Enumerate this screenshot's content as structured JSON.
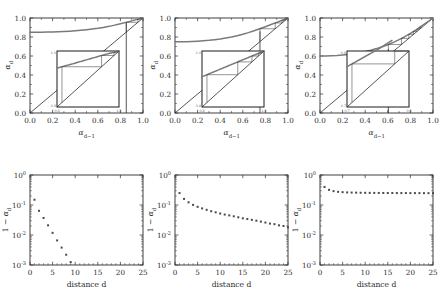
{
  "figure": {
    "panel_count": 6,
    "rows": 2,
    "columns": 3
  },
  "axes": {
    "top_xlabel": "α_{d−1}",
    "top_ylabel": "α_d",
    "bottom_xlabel": "distance d",
    "bottom_ylabel": "1 − α_d",
    "top_xticks": [
      "0.0",
      "0.2",
      "0.4",
      "0.6",
      "0.8",
      "1.0"
    ],
    "top_yticks": [
      "0.0",
      "0.2",
      "0.4",
      "0.6",
      "0.8",
      "1.0"
    ],
    "bottom_xticks": [
      "0",
      "5",
      "10",
      "15",
      "20",
      "25"
    ],
    "bottom_yticks": [
      "10^0",
      "10^-1",
      "10^-2",
      "10^-3"
    ],
    "bottom_ytick_exponents": [
      "0",
      "-1",
      "-2",
      "-3"
    ]
  },
  "colors": {
    "curve": "#7a7a7a",
    "diagonal": "#2b2b2b",
    "marker": "#4a4a4a",
    "axis": "#2b2b2b",
    "background": "#ffffff"
  },
  "chart_data": [
    {
      "id": "top-left",
      "type": "line",
      "title": "",
      "xlabel": "α_{d−1}",
      "ylabel": "α_d",
      "xlim": [
        0.0,
        1.0
      ],
      "ylim": [
        0.0,
        1.0
      ],
      "grid": false,
      "legend": "none",
      "series": [
        {
          "name": "map curve",
          "note": "recursion map α_d = f(α_{d-1}), intercept 0.85 at x=0 rising to 1.0 at x=1",
          "x": [
            0.0,
            0.05,
            0.1,
            0.15,
            0.2,
            0.25,
            0.3,
            0.35,
            0.4,
            0.45,
            0.5,
            0.55,
            0.6,
            0.65,
            0.7,
            0.75,
            0.8,
            0.85,
            0.9,
            0.95,
            1.0
          ],
          "y": [
            0.85,
            0.85,
            0.851,
            0.852,
            0.853,
            0.855,
            0.858,
            0.861,
            0.865,
            0.87,
            0.876,
            0.883,
            0.891,
            0.901,
            0.912,
            0.925,
            0.939,
            0.954,
            0.97,
            0.986,
            1.0
          ]
        },
        {
          "name": "identity diagonal",
          "x": [
            0.0,
            1.0
          ],
          "y": [
            0.0,
            1.0
          ]
        },
        {
          "name": "fixed point vertical",
          "x_value": 0.852,
          "y_range": [
            0.0,
            0.952
          ]
        }
      ],
      "inset": {
        "xlim": [
          0.8,
          1.0
        ],
        "ylim": [
          0.8,
          1.0
        ],
        "xticks": [
          "0.8",
          "1.0"
        ],
        "yticks": [
          "0.8",
          "1.0"
        ],
        "note": "cobweb staircase converging to fixed point"
      }
    },
    {
      "id": "top-middle",
      "type": "line",
      "title": "",
      "xlabel": "α_{d−1}",
      "ylabel": "α_d",
      "xlim": [
        0.0,
        1.0
      ],
      "ylim": [
        0.0,
        1.0
      ],
      "grid": false,
      "legend": "none",
      "series": [
        {
          "name": "map curve",
          "note": "intercept 0.75 at x=0 rising to 1.0 at x=1",
          "x": [
            0.0,
            0.05,
            0.1,
            0.15,
            0.2,
            0.25,
            0.3,
            0.35,
            0.4,
            0.45,
            0.5,
            0.55,
            0.6,
            0.65,
            0.7,
            0.75,
            0.8,
            0.85,
            0.9,
            0.95,
            1.0
          ],
          "y": [
            0.75,
            0.75,
            0.751,
            0.753,
            0.756,
            0.76,
            0.765,
            0.772,
            0.78,
            0.79,
            0.801,
            0.814,
            0.829,
            0.846,
            0.865,
            0.886,
            0.908,
            0.931,
            0.954,
            0.977,
            1.0
          ]
        },
        {
          "name": "identity diagonal",
          "x": [
            0.0,
            1.0
          ],
          "y": [
            0.0,
            1.0
          ]
        },
        {
          "name": "fixed point vertical",
          "x_value": 0.752,
          "y_range": [
            0.0,
            0.86
          ]
        }
      ],
      "inset": {
        "xlim": [
          0.8,
          1.0
        ],
        "ylim": [
          0.8,
          1.0
        ],
        "xticks": [
          "0.8",
          "1.0"
        ],
        "yticks": [
          "0.8",
          "1.0"
        ],
        "note": "cobweb staircase, slower convergence"
      }
    },
    {
      "id": "top-right",
      "type": "line",
      "title": "",
      "xlabel": "α_{d−1}",
      "ylabel": "α_d",
      "xlim": [
        0.0,
        1.0
      ],
      "ylim": [
        0.0,
        1.0
      ],
      "grid": false,
      "legend": "none",
      "series": [
        {
          "name": "map curve",
          "note": "intercept 0.60 at x=0 rising to 1.0 at x=1",
          "x": [
            0.0,
            0.05,
            0.1,
            0.15,
            0.2,
            0.25,
            0.3,
            0.35,
            0.4,
            0.45,
            0.5,
            0.55,
            0.6,
            0.65,
            0.7,
            0.75,
            0.8,
            0.85,
            0.9,
            0.95,
            1.0
          ],
          "y": [
            0.6,
            0.601,
            0.603,
            0.606,
            0.611,
            0.617,
            0.625,
            0.635,
            0.647,
            0.661,
            0.678,
            0.697,
            0.719,
            0.744,
            0.772,
            0.803,
            0.838,
            0.876,
            0.916,
            0.958,
            1.0
          ]
        },
        {
          "name": "identity diagonal",
          "x": [
            0.0,
            1.0
          ],
          "y": [
            0.0,
            1.0
          ]
        },
        {
          "name": "fixed point vertical",
          "x_value": 0.605,
          "y_range": [
            0.0,
            0.675
          ]
        }
      ],
      "inset": {
        "xlim": [
          0.7,
          0.8
        ],
        "ylim": [
          0.7,
          0.8
        ],
        "xticks": [
          "0.7",
          "0.8"
        ],
        "yticks": [
          "0.7",
          "0.8"
        ],
        "note": "cobweb staircase, very slow convergence"
      }
    },
    {
      "id": "bottom-left",
      "type": "scatter",
      "title": "",
      "xlabel": "distance d",
      "ylabel": "1 − α_d",
      "xlim": [
        0,
        25
      ],
      "ylim": [
        0.001,
        1.0
      ],
      "yscale": "log",
      "grid": false,
      "legend": "none",
      "marker": "square",
      "note": "fast exponential decay, points vanish below 10^-3 after d≈9",
      "x": [
        1,
        2,
        3,
        4,
        5,
        6,
        7,
        8,
        9
      ],
      "y": [
        0.15,
        0.064,
        0.037,
        0.021,
        0.0118,
        0.0066,
        0.0038,
        0.0022,
        0.00125
      ]
    },
    {
      "id": "bottom-middle",
      "type": "scatter",
      "title": "",
      "xlabel": "distance d",
      "ylabel": "1 − α_d",
      "xlim": [
        0,
        25
      ],
      "ylim": [
        0.001,
        1.0
      ],
      "yscale": "log",
      "grid": false,
      "legend": "none",
      "marker": "square",
      "note": "slow power-law-like decay from 0.25 to 0.018",
      "x": [
        1,
        2,
        3,
        4,
        5,
        6,
        7,
        8,
        9,
        10,
        11,
        12,
        13,
        14,
        15,
        16,
        17,
        18,
        19,
        20,
        21,
        22,
        23,
        24,
        25
      ],
      "y": [
        0.25,
        0.16,
        0.123,
        0.101,
        0.087,
        0.077,
        0.069,
        0.062,
        0.057,
        0.052,
        0.048,
        0.045,
        0.042,
        0.039,
        0.036,
        0.034,
        0.032,
        0.03,
        0.028,
        0.026,
        0.024,
        0.023,
        0.021,
        0.02,
        0.018
      ]
    },
    {
      "id": "bottom-right",
      "type": "scatter",
      "title": "",
      "xlabel": "distance d",
      "ylabel": "1 − α_d",
      "xlim": [
        0,
        25
      ],
      "ylim": [
        0.001,
        1.0
      ],
      "yscale": "log",
      "grid": false,
      "legend": "none",
      "marker": "square",
      "note": "saturates to plateau near 0.25",
      "x": [
        1,
        2,
        3,
        4,
        5,
        6,
        7,
        8,
        9,
        10,
        11,
        12,
        13,
        14,
        15,
        16,
        17,
        18,
        19,
        20,
        21,
        22,
        23,
        24,
        25
      ],
      "y": [
        0.4,
        0.32,
        0.29,
        0.275,
        0.268,
        0.263,
        0.26,
        0.258,
        0.256,
        0.255,
        0.254,
        0.253,
        0.252,
        0.252,
        0.251,
        0.251,
        0.25,
        0.25,
        0.25,
        0.249,
        0.249,
        0.249,
        0.248,
        0.248,
        0.248
      ]
    }
  ]
}
